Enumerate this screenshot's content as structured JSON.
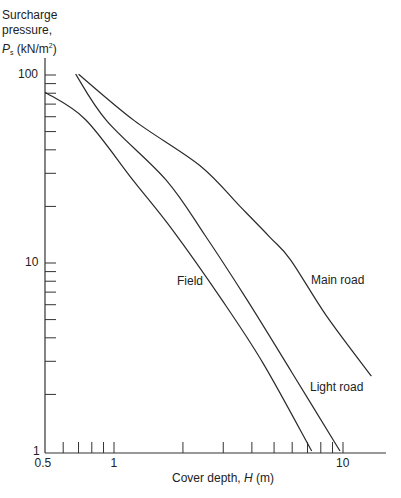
{
  "chart_data": {
    "type": "line",
    "title": "",
    "ylabel_lines": [
      "Surcharge",
      "pressure,"
    ],
    "ylabel_symbol": "P",
    "ylabel_subscript": "s",
    "ylabel_unit": " (kN/m",
    "ylabel_unit_sup": "2",
    "ylabel_unit_close": ")",
    "xlabel_text": "Cover depth, ",
    "xlabel_symbol": "H",
    "xlabel_unit": " (m)",
    "xscale": "log",
    "yscale": "log",
    "xlim": [
      0.5,
      15
    ],
    "ylim": [
      1,
      120
    ],
    "x_tick_labels": [
      {
        "value": 0.5,
        "label": "0.5"
      },
      {
        "value": 1,
        "label": "1"
      },
      {
        "value": 10,
        "label": "10"
      }
    ],
    "y_tick_labels": [
      {
        "value": 1,
        "label": "1"
      },
      {
        "value": 10,
        "label": "10"
      },
      {
        "value": 100,
        "label": "100"
      }
    ],
    "x_minor_ticks": [
      0.6,
      0.7,
      0.8,
      0.9,
      1,
      2,
      3,
      4,
      5,
      6,
      7,
      8,
      9,
      10
    ],
    "y_minor_ticks": [
      2,
      3,
      4,
      5,
      6,
      7,
      8,
      9,
      10,
      20,
      30,
      40,
      50,
      60,
      70,
      80,
      90,
      100
    ],
    "grid": false,
    "legend": "inline labels",
    "series": [
      {
        "name": "Field",
        "label_pos": [
          177,
          282
        ],
        "points": [
          [
            0.5,
            81
          ],
          [
            0.75,
            58
          ],
          [
            1.21,
            27.6
          ],
          [
            1.8,
            15
          ],
          [
            2.95,
            6.4
          ],
          [
            4.5,
            2.9
          ],
          [
            7.3,
            1
          ]
        ]
      },
      {
        "name": "Light road",
        "label_pos": [
          310,
          388
        ],
        "points": [
          [
            0.68,
            101
          ],
          [
            0.93,
            57
          ],
          [
            1.69,
            27.6
          ],
          [
            2.5,
            14
          ],
          [
            3.8,
            6.4
          ],
          [
            6.0,
            2.6
          ],
          [
            9.7,
            1
          ]
        ]
      },
      {
        "name": "Main road",
        "label_pos": [
          311,
          281
        ],
        "points": [
          [
            0.7,
            101
          ],
          [
            1.23,
            57
          ],
          [
            2.37,
            33
          ],
          [
            3.55,
            20
          ],
          [
            4.8,
            13.7
          ],
          [
            5.9,
            10.4
          ],
          [
            8.5,
            5.2
          ],
          [
            13.3,
            2.5
          ]
        ]
      }
    ]
  }
}
